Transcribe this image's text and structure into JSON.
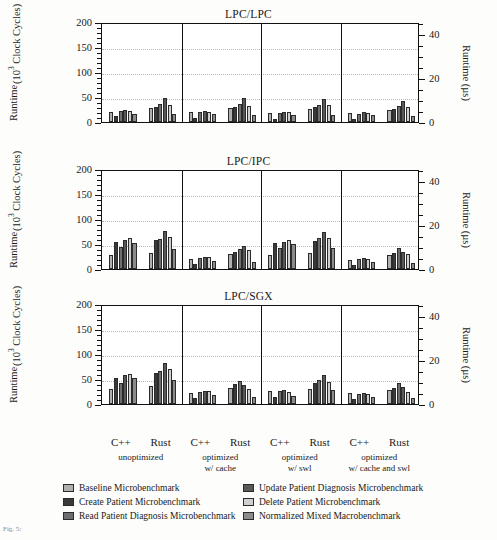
{
  "figure": {
    "caption_fragment": "Fig. 5:",
    "axis_title_left_line1": "Runtime",
    "axis_title_left_line2": "(10",
    "axis_title_left_sup": "3",
    "axis_title_left_line3": " Clock Cycles)",
    "axis_title_right": "Runtime (µs)"
  },
  "legend": {
    "columns": [
      [
        {
          "label": "Baseline Microbenchmark",
          "color": "#b0b0b0"
        },
        {
          "label": "Create Patient Microbenchmark",
          "color": "#3a3a3a"
        },
        {
          "label": "Read Patient Diagnosis Microbenchmark",
          "color": "#6e6e6e"
        }
      ],
      [
        {
          "label": "Update Patient Diagnosis Microbenchmark",
          "color": "#585858"
        },
        {
          "label": "Delete Patient Microbenchmark",
          "color": "#cfcfcf"
        },
        {
          "label": "Normalized Mixed Macrobenchmark",
          "color": "#8c8c8c"
        }
      ]
    ]
  },
  "chart_data": {
    "type": "bar",
    "xlabel": "",
    "ylabel": "Runtime (10^3 Clock Cycles)",
    "ylabel_right": "Runtime (µs)",
    "ylim": [
      0,
      200
    ],
    "yticks": [
      0,
      50,
      100,
      150,
      200
    ],
    "ylim_right": [
      0,
      45.45
    ],
    "yticks_right": [
      0,
      20,
      40
    ],
    "grid": true,
    "legend_position": "below",
    "sections": [
      "unoptimized",
      "optimized\nw/ cache",
      "optimized\nw/ swl",
      "optimized\nw/ cache and swl"
    ],
    "section_labels": [
      {
        "line1": "unoptimized",
        "line2": ""
      },
      {
        "line1": "optimized",
        "line2": "w/ cache"
      },
      {
        "line1": "optimized",
        "line2": "w/ swl"
      },
      {
        "line1": "optimized",
        "line2": "w/ cache and swl"
      }
    ],
    "languages": [
      "C++",
      "Rust"
    ],
    "series": [
      {
        "name": "Baseline Microbenchmark",
        "color": "#b0b0b0"
      },
      {
        "name": "Create Patient Microbenchmark",
        "color": "#3a3a3a"
      },
      {
        "name": "Read Patient Diagnosis Microbenchmark",
        "color": "#6e6e6e"
      },
      {
        "name": "Update Patient Diagnosis Microbenchmark",
        "color": "#585858"
      },
      {
        "name": "Delete Patient Microbenchmark",
        "color": "#cfcfcf"
      },
      {
        "name": "Normalized Mixed Macrobenchmark",
        "color": "#8c8c8c"
      }
    ],
    "panels": [
      {
        "title": "LPC/LPC",
        "groups": [
          {
            "section": "unoptimized",
            "language": "C++",
            "values": [
              21,
              12,
              23,
              24,
              22,
              17
            ]
          },
          {
            "section": "unoptimized",
            "language": "Rust",
            "values": [
              28,
              30,
              36,
              48,
              35,
              16
            ]
          },
          {
            "section": "optimized w/ cache",
            "language": "C++",
            "values": [
              20,
              9,
              20,
              23,
              21,
              16
            ]
          },
          {
            "section": "optimized w/ cache",
            "language": "Rust",
            "values": [
              28,
              30,
              36,
              48,
              33,
              15
            ]
          },
          {
            "section": "optimized w/ swl",
            "language": "C++",
            "values": [
              19,
              7,
              18,
              20,
              21,
              15
            ]
          },
          {
            "section": "optimized w/ swl",
            "language": "Rust",
            "values": [
              26,
              30,
              35,
              47,
              34,
              14
            ]
          },
          {
            "section": "optimized w/ cache and swl",
            "language": "C++",
            "values": [
              18,
              6,
              16,
              20,
              19,
              14
            ]
          },
          {
            "section": "optimized w/ cache and swl",
            "language": "Rust",
            "values": [
              24,
              27,
              32,
              43,
              30,
              13
            ]
          }
        ]
      },
      {
        "title": "LPC/IPC",
        "groups": [
          {
            "section": "unoptimized",
            "language": "C++",
            "values": [
              28,
              55,
              45,
              58,
              62,
              52
            ]
          },
          {
            "section": "unoptimized",
            "language": "Rust",
            "values": [
              32,
              58,
              60,
              76,
              65,
              40
            ]
          },
          {
            "section": "optimized w/ cache",
            "language": "C++",
            "values": [
              20,
              11,
              22,
              25,
              24,
              17
            ]
          },
          {
            "section": "optimized w/ cache",
            "language": "Rust",
            "values": [
              30,
              35,
              40,
              47,
              38,
              15
            ]
          },
          {
            "section": "optimized w/ swl",
            "language": "C++",
            "values": [
              28,
              52,
              42,
              55,
              58,
              50
            ]
          },
          {
            "section": "optimized w/ swl",
            "language": "Rust",
            "values": [
              32,
              56,
              62,
              75,
              63,
              43
            ]
          },
          {
            "section": "optimized w/ cache and swl",
            "language": "C++",
            "values": [
              18,
              9,
              20,
              22,
              21,
              15
            ]
          },
          {
            "section": "optimized w/ cache and swl",
            "language": "Rust",
            "values": [
              28,
              33,
              42,
              35,
              30,
              13
            ]
          }
        ]
      },
      {
        "title": "LPC/SGX",
        "groups": [
          {
            "section": "unoptimized",
            "language": "C++",
            "values": [
              30,
              52,
              42,
              58,
              60,
              52
            ]
          },
          {
            "section": "unoptimized",
            "language": "Rust",
            "values": [
              36,
              62,
              66,
              82,
              70,
              48
            ]
          },
          {
            "section": "optimized w/ cache",
            "language": "C++",
            "values": [
              22,
              13,
              25,
              27,
              26,
              18
            ]
          },
          {
            "section": "optimized w/ cache",
            "language": "Rust",
            "values": [
              32,
              40,
              46,
              38,
              30,
              15
            ]
          },
          {
            "section": "optimized w/ swl",
            "language": "C++",
            "values": [
              26,
              14,
              26,
              28,
              25,
              17
            ]
          },
          {
            "section": "optimized w/ swl",
            "language": "Rust",
            "values": [
              30,
              42,
              48,
              58,
              44,
              28
            ]
          },
          {
            "section": "optimized w/ cache and swl",
            "language": "C++",
            "values": [
              22,
              10,
              21,
              23,
              20,
              15
            ]
          },
          {
            "section": "optimized w/ cache and swl",
            "language": "Rust",
            "values": [
              28,
              32,
              43,
              35,
              24,
              12
            ]
          }
        ]
      }
    ]
  }
}
